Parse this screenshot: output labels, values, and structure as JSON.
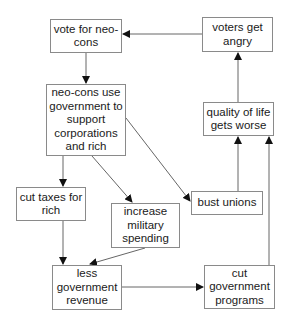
{
  "diagram": {
    "type": "flowchart",
    "nodes": {
      "vote": {
        "label": "vote for neo-cons"
      },
      "angry": {
        "label": "voters get angry"
      },
      "neocons": {
        "label": "neo-cons use government to support corporations and rich"
      },
      "quality": {
        "label": "quality of life gets worse"
      },
      "taxes": {
        "label": "cut taxes for rich"
      },
      "military": {
        "label": "increase military spending"
      },
      "unions": {
        "label": "bust unions"
      },
      "revenue": {
        "label": "less government revenue"
      },
      "programs": {
        "label": "cut government programs"
      }
    },
    "edges": [
      {
        "from": "vote",
        "to": "neocons"
      },
      {
        "from": "neocons",
        "to": "taxes"
      },
      {
        "from": "neocons",
        "to": "military"
      },
      {
        "from": "neocons",
        "to": "unions"
      },
      {
        "from": "taxes",
        "to": "revenue"
      },
      {
        "from": "military",
        "to": "revenue"
      },
      {
        "from": "revenue",
        "to": "programs"
      },
      {
        "from": "unions",
        "to": "quality"
      },
      {
        "from": "programs",
        "to": "quality"
      },
      {
        "from": "quality",
        "to": "angry"
      },
      {
        "from": "angry",
        "to": "vote"
      }
    ],
    "colors": {
      "line": "#555555",
      "border": "#8a8a8a",
      "text": "#1a1a1a"
    }
  }
}
